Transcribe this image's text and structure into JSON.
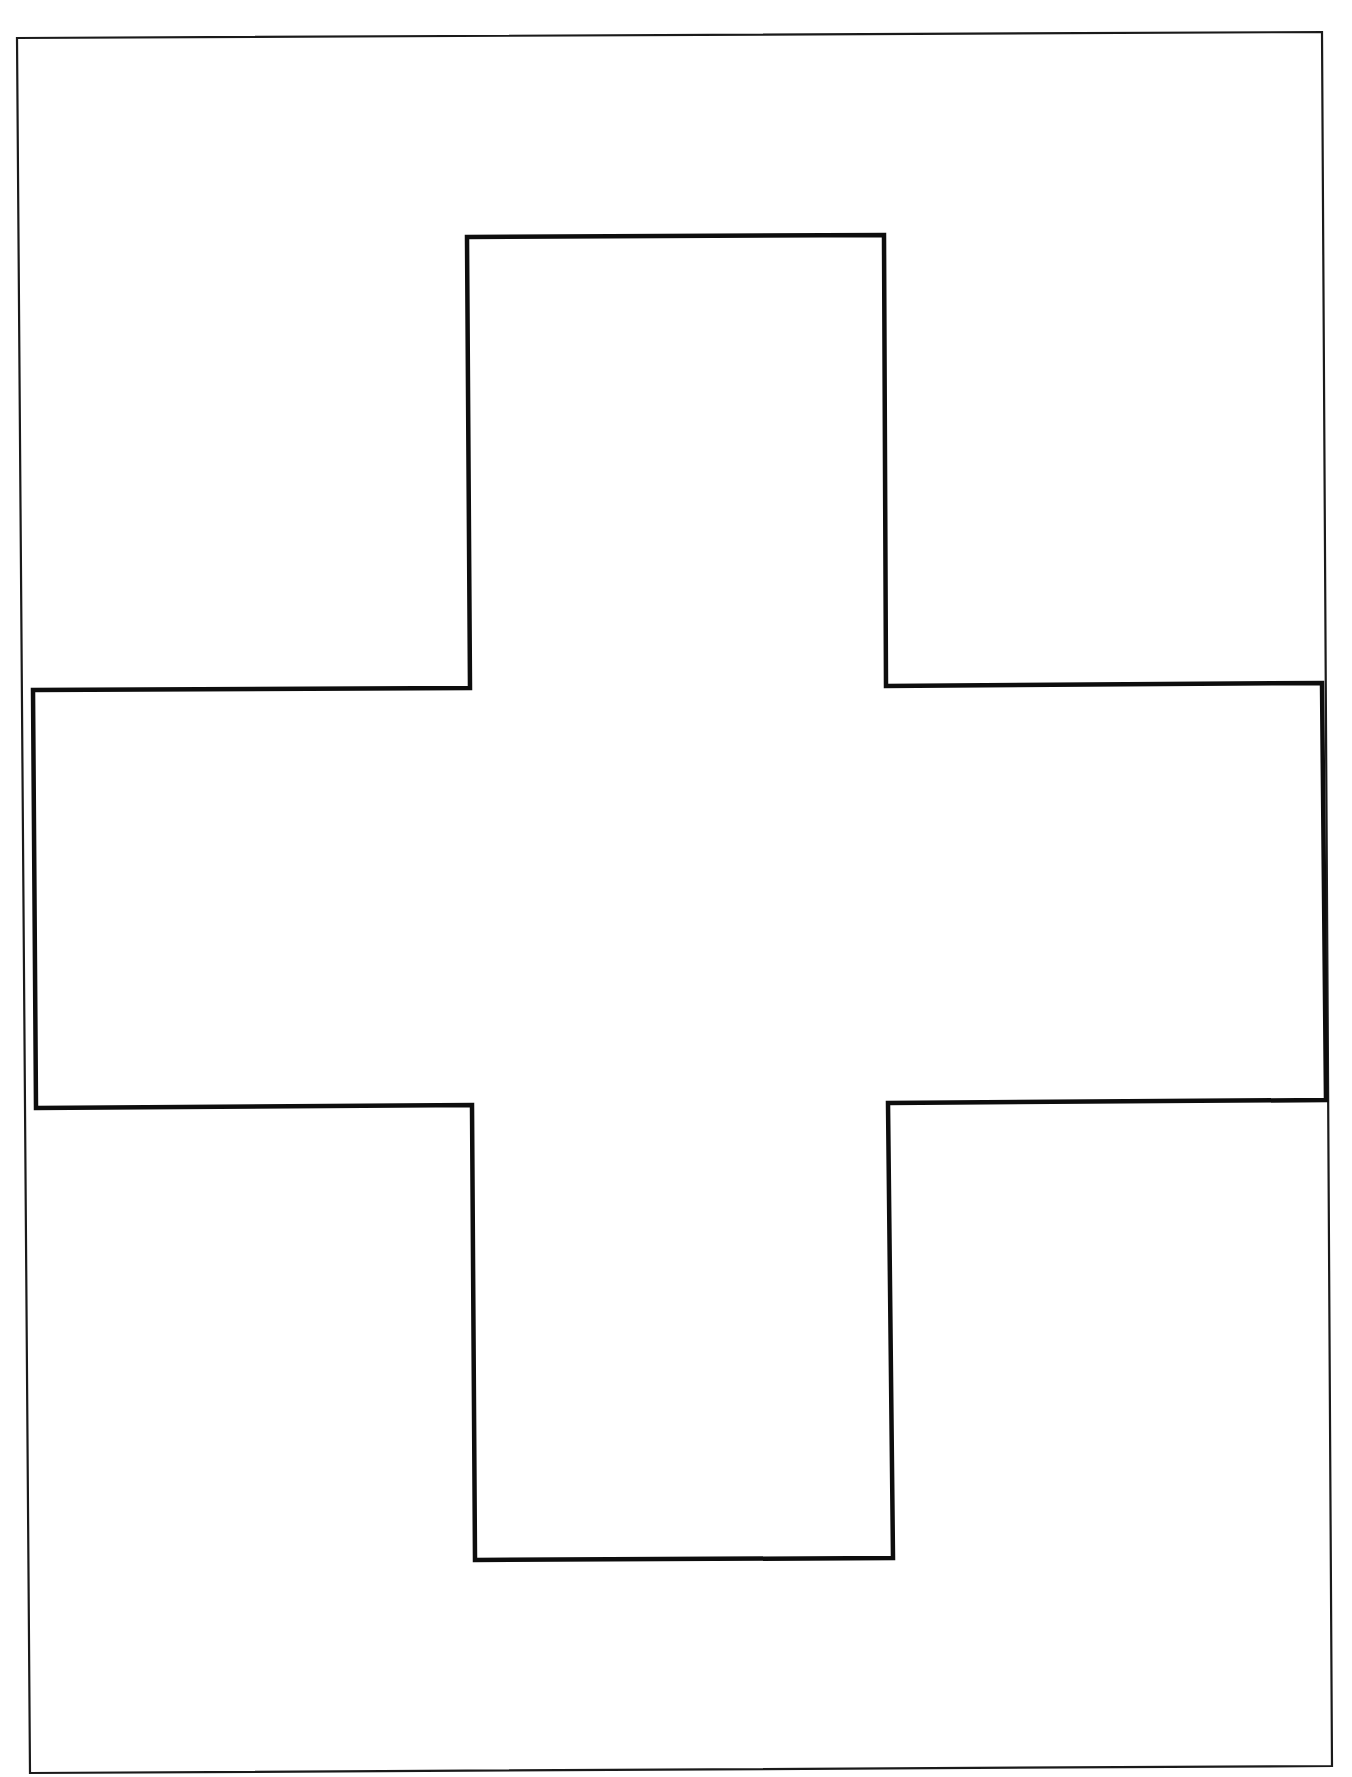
{
  "document": {
    "type": "worksheet-template",
    "shape": "cross",
    "background_color": "#ffffff",
    "line_color": "#0d0d0d"
  },
  "frame": {
    "corners": [
      [
        17,
        38
      ],
      [
        1322,
        32
      ],
      [
        1332,
        1766
      ],
      [
        30,
        1773
      ]
    ],
    "stroke_width": 2.2
  },
  "cross": {
    "points": [
      [
        467,
        237
      ],
      [
        884,
        235
      ],
      [
        886,
        686
      ],
      [
        1322,
        683
      ],
      [
        1326,
        1100
      ],
      [
        888,
        1103
      ],
      [
        893,
        1558
      ],
      [
        475,
        1560
      ],
      [
        472,
        1105
      ],
      [
        36,
        1108
      ],
      [
        33,
        690
      ],
      [
        470,
        688
      ]
    ],
    "stroke_width": 4.5
  }
}
